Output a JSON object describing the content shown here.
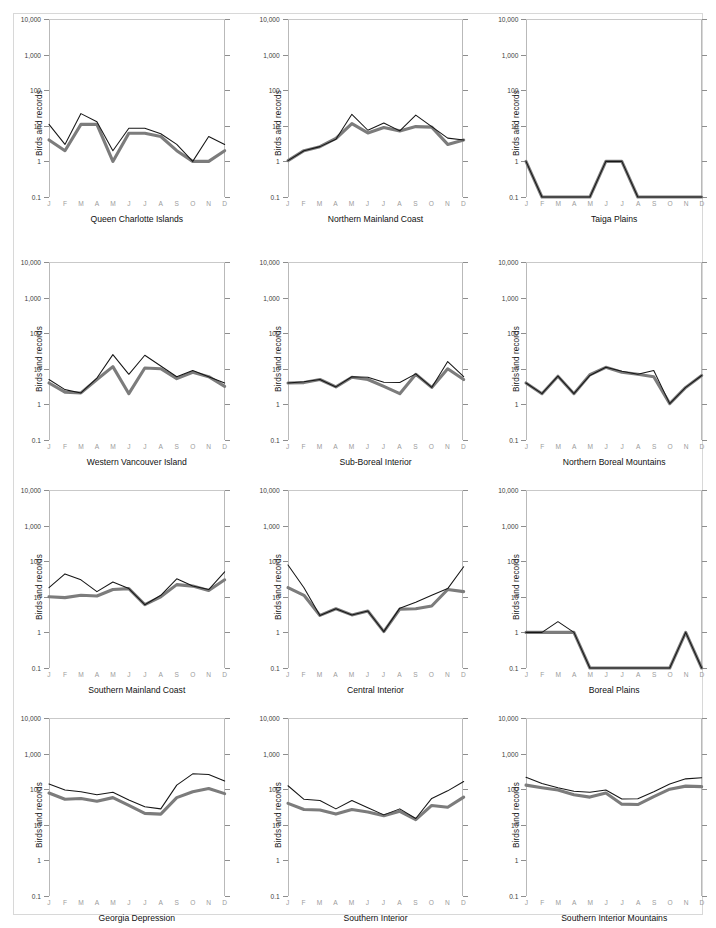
{
  "figure": {
    "ylabel": "Birds and records",
    "month_ticks": [
      "J",
      "F",
      "M",
      "A",
      "M",
      "J",
      "J",
      "A",
      "S",
      "O",
      "N",
      "D"
    ],
    "y_tick_labels": [
      "10,000",
      "1,000",
      "100",
      "10",
      "1",
      "0.1"
    ],
    "colors": {
      "records_line": "#7c7c7c",
      "birds_line": "#161616",
      "frame": "#b9b9b9",
      "grid": "#c9c9c9"
    }
  },
  "chart_data": [
    {
      "type": "line",
      "title": "Queen Charlotte Islands",
      "xlabel": "",
      "ylabel": "Birds and records",
      "yscale": "log",
      "ylim": [
        0.1,
        10000
      ],
      "grid": false,
      "legend": "none",
      "categories": [
        "J",
        "F",
        "M",
        "A",
        "M",
        "J",
        "J",
        "A",
        "S",
        "O",
        "N",
        "D"
      ],
      "series": [
        {
          "name": "records",
          "values": [
            11,
            3,
            22,
            13,
            2,
            8.5,
            8.5,
            6,
            3,
            1,
            5,
            3
          ]
        },
        {
          "name": "birds",
          "values": [
            4,
            2,
            11,
            11,
            1,
            6.2,
            6.2,
            5,
            2,
            1,
            1,
            2
          ]
        }
      ]
    },
    {
      "type": "line",
      "title": "Northern Mainland Coast",
      "xlabel": "",
      "ylabel": "Birds and records",
      "yscale": "log",
      "ylim": [
        0.1,
        10000
      ],
      "grid": false,
      "legend": "none",
      "categories": [
        "J",
        "F",
        "M",
        "A",
        "M",
        "J",
        "J",
        "A",
        "S",
        "O",
        "N",
        "D"
      ],
      "series": [
        {
          "name": "records",
          "values": [
            1.05,
            2,
            2.6,
            4.2,
            21,
            7.5,
            12,
            7.2,
            20,
            9.5,
            4.5,
            4
          ]
        },
        {
          "name": "birds",
          "values": [
            1.05,
            2,
            2.6,
            4.4,
            11.5,
            6.3,
            9,
            7.2,
            9.5,
            9.2,
            3,
            4
          ]
        }
      ]
    },
    {
      "type": "line",
      "title": "Taiga Plains",
      "xlabel": "",
      "ylabel": "Birds and records",
      "yscale": "log",
      "ylim": [
        0.1,
        10000
      ],
      "grid": false,
      "legend": "none",
      "categories": [
        "J",
        "F",
        "M",
        "A",
        "M",
        "J",
        "J",
        "A",
        "S",
        "O",
        "N",
        "D"
      ],
      "series": [
        {
          "name": "records",
          "values": [
            1,
            0.1,
            0.1,
            0.1,
            0.1,
            1,
            1,
            0.1,
            0.1,
            0.1,
            0.1,
            0.1
          ]
        },
        {
          "name": "birds",
          "values": [
            1,
            0.1,
            0.1,
            0.1,
            0.1,
            1,
            1,
            0.1,
            0.1,
            0.1,
            0.1,
            0.1
          ]
        }
      ]
    },
    {
      "type": "line",
      "title": "Western Vancouver Island",
      "xlabel": "",
      "ylabel": "Birds and records",
      "yscale": "log",
      "ylim": [
        0.1,
        10000
      ],
      "grid": false,
      "legend": "none",
      "categories": [
        "J",
        "F",
        "M",
        "A",
        "M",
        "J",
        "J",
        "A",
        "S",
        "O",
        "N",
        "D"
      ],
      "series": [
        {
          "name": "records",
          "values": [
            5,
            2.6,
            2.1,
            5.5,
            25,
            7,
            24,
            12,
            6,
            9,
            6,
            4
          ]
        },
        {
          "name": "birds",
          "values": [
            4,
            2.2,
            2.1,
            5,
            11.5,
            2,
            10.5,
            10,
            5.3,
            8,
            6,
            3.2
          ]
        }
      ]
    },
    {
      "type": "line",
      "title": "Sub-Boreal Interior",
      "xlabel": "",
      "ylabel": "Birds and records",
      "yscale": "log",
      "ylim": [
        0.1,
        10000
      ],
      "grid": false,
      "legend": "none",
      "categories": [
        "J",
        "F",
        "M",
        "A",
        "M",
        "J",
        "J",
        "A",
        "S",
        "O",
        "N",
        "D"
      ],
      "series": [
        {
          "name": "records",
          "values": [
            4,
            4.3,
            5,
            3.1,
            6,
            5.8,
            4.2,
            4.1,
            7.2,
            3,
            16,
            6
          ]
        },
        {
          "name": "birds",
          "values": [
            4,
            4.1,
            5,
            3.1,
            5.8,
            5,
            3.2,
            2,
            7,
            3,
            10,
            5
          ]
        }
      ]
    },
    {
      "type": "line",
      "title": "Northern Boreal Mountains",
      "xlabel": "",
      "ylabel": "Birds and records",
      "yscale": "log",
      "ylim": [
        0.1,
        10000
      ],
      "grid": false,
      "legend": "none",
      "categories": [
        "J",
        "F",
        "M",
        "A",
        "M",
        "J",
        "J",
        "A",
        "S",
        "O",
        "N",
        "D"
      ],
      "series": [
        {
          "name": "records",
          "values": [
            4,
            2,
            6.2,
            2,
            6.5,
            11,
            8.5,
            7,
            9,
            1.05,
            3,
            6.5
          ]
        },
        {
          "name": "birds",
          "values": [
            4,
            2,
            6.2,
            2,
            6.8,
            11,
            8,
            7,
            6,
            1.05,
            3,
            6.5
          ]
        }
      ]
    },
    {
      "type": "line",
      "title": "Southern Mainland Coast",
      "xlabel": "",
      "ylabel": "Birds and records",
      "yscale": "log",
      "ylim": [
        0.1,
        10000
      ],
      "grid": false,
      "legend": "none",
      "categories": [
        "J",
        "F",
        "M",
        "A",
        "M",
        "J",
        "J",
        "A",
        "S",
        "O",
        "N",
        "D"
      ],
      "series": [
        {
          "name": "records",
          "values": [
            18,
            44,
            30,
            14,
            26,
            17,
            6,
            11,
            32,
            20,
            16,
            50
          ]
        },
        {
          "name": "birds",
          "values": [
            10,
            9.5,
            11,
            10.5,
            16,
            17,
            6,
            10,
            22,
            20,
            15,
            30
          ]
        }
      ]
    },
    {
      "type": "line",
      "title": "Central Interior",
      "xlabel": "",
      "ylabel": "Birds and records",
      "yscale": "log",
      "ylim": [
        0.1,
        10000
      ],
      "grid": false,
      "legend": "none",
      "categories": [
        "J",
        "F",
        "M",
        "A",
        "M",
        "J",
        "J",
        "A",
        "S",
        "O",
        "N",
        "D"
      ],
      "series": [
        {
          "name": "records",
          "values": [
            78,
            18,
            3,
            4.6,
            3.1,
            4,
            1.05,
            4.8,
            7,
            11,
            17,
            70
          ]
        },
        {
          "name": "birds",
          "values": [
            18,
            11,
            3,
            4.6,
            3.1,
            4,
            1.05,
            4.5,
            4.6,
            5.5,
            16,
            14
          ]
        }
      ]
    },
    {
      "type": "line",
      "title": "Boreal Plains",
      "xlabel": "",
      "ylabel": "Birds and records",
      "yscale": "log",
      "ylim": [
        0.1,
        10000
      ],
      "grid": false,
      "legend": "none",
      "categories": [
        "J",
        "F",
        "M",
        "A",
        "M",
        "J",
        "J",
        "A",
        "S",
        "O",
        "N",
        "D"
      ],
      "series": [
        {
          "name": "records",
          "values": [
            1,
            1,
            2,
            1,
            0.1,
            0.1,
            0.1,
            0.1,
            0.1,
            0.1,
            1,
            0.1
          ]
        },
        {
          "name": "birds",
          "values": [
            1,
            1,
            1,
            1,
            0.1,
            0.1,
            0.1,
            0.1,
            0.1,
            0.1,
            1,
            0.1
          ]
        }
      ]
    },
    {
      "type": "line",
      "title": "Georgia Depression",
      "xlabel": "",
      "ylabel": "Birds and records",
      "yscale": "log",
      "ylim": [
        0.1,
        10000
      ],
      "grid": false,
      "legend": "none",
      "categories": [
        "J",
        "F",
        "M",
        "A",
        "M",
        "J",
        "J",
        "A",
        "S",
        "O",
        "N",
        "D"
      ],
      "series": [
        {
          "name": "records",
          "values": [
            140,
            95,
            85,
            70,
            82,
            50,
            32,
            28,
            130,
            270,
            260,
            170
          ]
        },
        {
          "name": "birds",
          "values": [
            78,
            52,
            55,
            46,
            58,
            35,
            21,
            20,
            58,
            85,
            105,
            75
          ]
        }
      ]
    },
    {
      "type": "line",
      "title": "Southern Interior",
      "xlabel": "",
      "ylabel": "Birds and records",
      "yscale": "log",
      "ylim": [
        0.1,
        10000
      ],
      "grid": false,
      "legend": "none",
      "categories": [
        "J",
        "F",
        "M",
        "A",
        "M",
        "J",
        "J",
        "A",
        "S",
        "O",
        "N",
        "D"
      ],
      "series": [
        {
          "name": "records",
          "values": [
            125,
            52,
            48,
            28,
            48,
            30,
            19,
            28,
            15,
            55,
            90,
            165
          ]
        },
        {
          "name": "birds",
          "values": [
            40,
            27,
            26,
            20,
            27,
            23,
            18,
            24,
            14,
            35,
            31,
            60
          ]
        }
      ]
    },
    {
      "type": "line",
      "title": "Southern Interior Mountains",
      "xlabel": "",
      "ylabel": "Birds and records",
      "yscale": "log",
      "ylim": [
        0.1,
        10000
      ],
      "grid": false,
      "legend": "none",
      "categories": [
        "J",
        "F",
        "M",
        "A",
        "M",
        "J",
        "J",
        "A",
        "S",
        "O",
        "N",
        "D"
      ],
      "series": [
        {
          "name": "records",
          "values": [
            215,
            145,
            110,
            88,
            82,
            95,
            53,
            54,
            85,
            140,
            195,
            210
          ]
        },
        {
          "name": "birds",
          "values": [
            130,
            110,
            95,
            70,
            60,
            78,
            38,
            37,
            62,
            100,
            122,
            118
          ]
        }
      ]
    }
  ]
}
